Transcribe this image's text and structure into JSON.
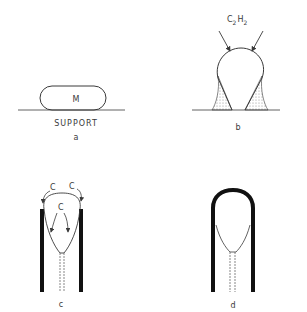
{
  "panels": {
    "a": {
      "label": "a",
      "particle_label": "M",
      "support_label": "SUPPORT"
    },
    "b": {
      "label": "b",
      "gas_label": "C",
      "gas_sub1": "2",
      "gas_h": "H",
      "gas_sub2": "2"
    },
    "c": {
      "label": "c",
      "carbon_labels": [
        "C",
        "C",
        "C"
      ]
    },
    "d": {
      "label": "d"
    }
  },
  "colors": {
    "ink": "#3a3a3a",
    "thick": "#111111",
    "background": "#ffffff"
  }
}
